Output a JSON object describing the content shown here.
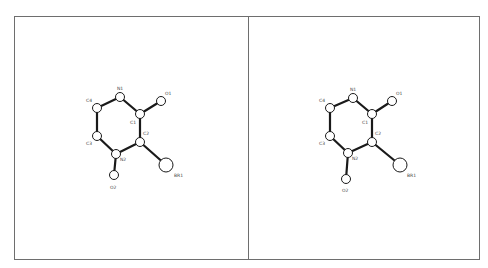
{
  "diagram": {
    "type": "stereo-molecular-structure",
    "panels": [
      {
        "id": "left",
        "atoms": [
          {
            "label": "N1",
            "x": 120,
            "y": 97,
            "r": 4.5,
            "lx": 117,
            "ly": 90
          },
          {
            "label": "C4",
            "x": 97,
            "y": 108,
            "r": 4.5,
            "lx": 86,
            "ly": 102
          },
          {
            "label": "C3",
            "x": 97,
            "y": 136,
            "r": 4.5,
            "lx": 86,
            "ly": 145
          },
          {
            "label": "N2",
            "x": 116,
            "y": 154,
            "r": 4.5,
            "lx": 120,
            "ly": 161
          },
          {
            "label": "O2",
            "x": 114,
            "y": 175,
            "r": 4.5,
            "lx": 110,
            "ly": 189
          },
          {
            "label": "C1",
            "x": 140,
            "y": 114,
            "r": 4.5,
            "lx": 130,
            "ly": 124
          },
          {
            "label": "O1",
            "x": 161,
            "y": 101,
            "r": 4.5,
            "lx": 165,
            "ly": 95
          },
          {
            "label": "C2",
            "x": 140,
            "y": 142,
            "r": 4.5,
            "lx": 143,
            "ly": 135
          },
          {
            "label": "BR1",
            "x": 166,
            "y": 165,
            "r": 7,
            "lx": 174,
            "ly": 177
          }
        ],
        "bonds": [
          [
            "N1",
            "C4"
          ],
          [
            "C4",
            "C3"
          ],
          [
            "C3",
            "N2"
          ],
          [
            "N2",
            "C2"
          ],
          [
            "C2",
            "C1"
          ],
          [
            "C1",
            "N1"
          ],
          [
            "C1",
            "O1"
          ],
          [
            "N2",
            "O2"
          ],
          [
            "C2",
            "BR1"
          ]
        ]
      },
      {
        "id": "right",
        "atoms": [
          {
            "label": "N1",
            "x": 353,
            "y": 98,
            "r": 4.5,
            "lx": 350,
            "ly": 91
          },
          {
            "label": "C4",
            "x": 330,
            "y": 108,
            "r": 4.5,
            "lx": 319,
            "ly": 102
          },
          {
            "label": "C3",
            "x": 330,
            "y": 136,
            "r": 4.5,
            "lx": 319,
            "ly": 145
          },
          {
            "label": "N2",
            "x": 348,
            "y": 153,
            "r": 4.5,
            "lx": 352,
            "ly": 160
          },
          {
            "label": "O2",
            "x": 346,
            "y": 179,
            "r": 4.5,
            "lx": 342,
            "ly": 192
          },
          {
            "label": "C1",
            "x": 372,
            "y": 114,
            "r": 4.5,
            "lx": 362,
            "ly": 124
          },
          {
            "label": "O1",
            "x": 392,
            "y": 101,
            "r": 4.5,
            "lx": 396,
            "ly": 95
          },
          {
            "label": "C2",
            "x": 372,
            "y": 142,
            "r": 4.5,
            "lx": 375,
            "ly": 135
          },
          {
            "label": "BR1",
            "x": 400,
            "y": 165,
            "r": 7,
            "lx": 407,
            "ly": 177
          }
        ],
        "bonds": [
          [
            "N1",
            "C4"
          ],
          [
            "C4",
            "C3"
          ],
          [
            "C3",
            "N2"
          ],
          [
            "N2",
            "C2"
          ],
          [
            "C2",
            "C1"
          ],
          [
            "C1",
            "N1"
          ],
          [
            "C1",
            "O1"
          ],
          [
            "N2",
            "O2"
          ],
          [
            "C2",
            "BR1"
          ]
        ]
      }
    ]
  }
}
